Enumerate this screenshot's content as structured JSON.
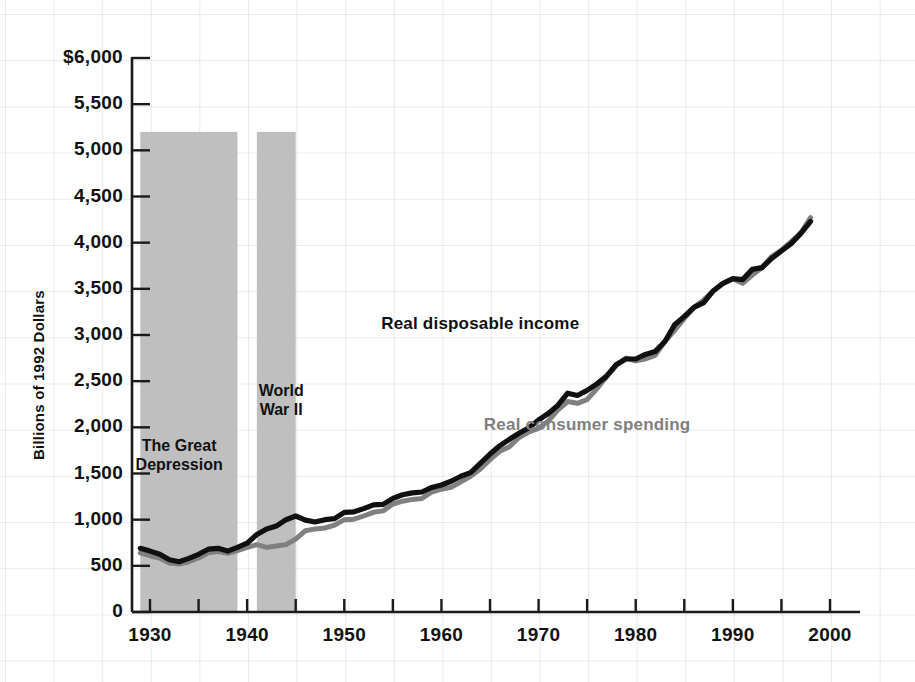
{
  "chart_data": {
    "type": "line",
    "title": "",
    "xlabel": "",
    "ylabel": "Billions of 1992 Dollars",
    "xlim": [
      1929,
      1999
    ],
    "ylim": [
      0,
      6000
    ],
    "y_ticks": [
      "$6,000",
      "5,500",
      "5,000",
      "4,500",
      "4,000",
      "3,500",
      "3,000",
      "2,500",
      "2,000",
      "1,500",
      "1,000",
      "500",
      "0"
    ],
    "y_tick_values": [
      6000,
      5500,
      5000,
      4500,
      4000,
      3500,
      3000,
      2500,
      2000,
      1500,
      1000,
      500,
      0
    ],
    "x_ticks": [
      "1930",
      "1940",
      "1950",
      "1960",
      "1970",
      "1980",
      "1990",
      "2000"
    ],
    "x_tick_values": [
      1930,
      1940,
      1950,
      1960,
      1970,
      1980,
      1990,
      2000
    ],
    "x_minor_tick_values": [
      1930,
      1935,
      1940,
      1945,
      1950,
      1955,
      1960,
      1965,
      1970,
      1975,
      1980,
      1985,
      1990,
      1995,
      2000
    ],
    "grid": true,
    "legend_position": "inline-annotations",
    "colors": {
      "income": "#101010",
      "spending": "#808080",
      "band": "#bfbfbf",
      "grid": "#c9cfda"
    },
    "shaded_bands": [
      {
        "label": "The Great Depression",
        "start": 1929,
        "end": 1939,
        "top_value": 5200
      },
      {
        "label": "World War II",
        "start": 1941,
        "end": 1945,
        "top_value": 5200
      }
    ],
    "x": [
      1929,
      1930,
      1931,
      1932,
      1933,
      1934,
      1935,
      1936,
      1937,
      1938,
      1939,
      1940,
      1941,
      1942,
      1943,
      1944,
      1945,
      1946,
      1947,
      1948,
      1949,
      1950,
      1951,
      1952,
      1953,
      1954,
      1955,
      1956,
      1957,
      1958,
      1959,
      1960,
      1961,
      1962,
      1963,
      1964,
      1965,
      1966,
      1967,
      1968,
      1969,
      1970,
      1971,
      1972,
      1973,
      1974,
      1975,
      1976,
      1977,
      1978,
      1979,
      1980,
      1981,
      1982,
      1983,
      1984,
      1985,
      1986,
      1987,
      1988,
      1989,
      1990,
      1991,
      1992,
      1993,
      1994,
      1995,
      1996,
      1997,
      1998
    ],
    "series": [
      {
        "name": "Real disposable income",
        "color": "#101010",
        "values": [
          690,
          660,
          625,
          565,
          545,
          580,
          625,
          680,
          690,
          660,
          700,
          745,
          840,
          900,
          930,
          1000,
          1040,
          995,
          975,
          1000,
          1010,
          1080,
          1085,
          1120,
          1160,
          1165,
          1230,
          1270,
          1290,
          1300,
          1350,
          1375,
          1415,
          1470,
          1510,
          1610,
          1710,
          1800,
          1870,
          1935,
          1995,
          2080,
          2150,
          2240,
          2370,
          2345,
          2400,
          2470,
          2555,
          2680,
          2740,
          2740,
          2790,
          2820,
          2930,
          3110,
          3200,
          3300,
          3350,
          3480,
          3560,
          3610,
          3600,
          3710,
          3730,
          3830,
          3910,
          3990,
          4100,
          4230
        ]
      },
      {
        "name": "Real consumer spending",
        "color": "#808080",
        "values": [
          640,
          610,
          585,
          530,
          520,
          545,
          585,
          640,
          655,
          635,
          665,
          700,
          730,
          700,
          715,
          730,
          790,
          880,
          900,
          910,
          940,
          1000,
          1005,
          1040,
          1080,
          1095,
          1170,
          1200,
          1220,
          1230,
          1300,
          1330,
          1350,
          1410,
          1470,
          1550,
          1650,
          1740,
          1790,
          1890,
          1950,
          1990,
          2070,
          2190,
          2280,
          2260,
          2300,
          2420,
          2550,
          2670,
          2750,
          2720,
          2740,
          2780,
          2930,
          3050,
          3180,
          3300,
          3380,
          3480,
          3560,
          3610,
          3560,
          3650,
          3730,
          3850,
          3920,
          4010,
          4110,
          4270
        ]
      }
    ],
    "annotations": [
      {
        "text": "The Great\nDepression",
        "x": 1933.0,
        "y": 1700
      },
      {
        "text": "World\nWar II",
        "x": 1943.5,
        "y": 2300
      },
      {
        "text": "Real disposable income",
        "x": 1964,
        "y": 3120,
        "color": "#101010"
      },
      {
        "text": "Real consumer spending",
        "x": 1975,
        "y": 2030,
        "color": "#808080"
      }
    ]
  }
}
